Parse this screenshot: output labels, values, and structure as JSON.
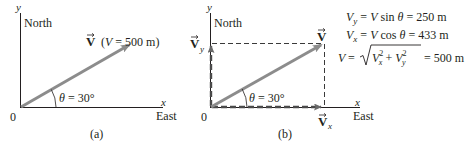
{
  "colors": {
    "axis": "#231f20",
    "vector": "#8c8c8c",
    "dashed": "#3a3a3a",
    "text": "#231f20",
    "background": "#ffffff"
  },
  "panel_a": {
    "caption": "(a)",
    "y_axis_label": "y",
    "x_axis_label": "x",
    "north_label": "North",
    "east_label": "East",
    "origin_label": "0",
    "vector_symbol": "V",
    "vector_annotation_open": "(",
    "vector_annotation_var": "V",
    "vector_annotation_rest": " = 500 m)",
    "angle_symbol": "θ",
    "angle_value": " = 30°"
  },
  "panel_b": {
    "caption": "(b)",
    "y_axis_label": "y",
    "x_axis_label": "x",
    "north_label": "North",
    "east_label": "East",
    "origin_label": "0",
    "vector_symbol": "V",
    "vy_symbol": "V",
    "vy_sub": "y",
    "vx_symbol": "V",
    "vx_sub": "x",
    "angle_symbol": "θ",
    "angle_value": " = 30°"
  },
  "equations": {
    "vy": {
      "lhs": "V",
      "lhs_sub": "y",
      "rhs_pre": " = ",
      "rhs_var": "V",
      "rhs_func": " sin ",
      "rhs_theta": "θ",
      "rhs_result": " = 250 m"
    },
    "vx": {
      "lhs": "V",
      "lhs_sub": "x",
      "rhs_pre": " = ",
      "rhs_var": "V",
      "rhs_func": " cos ",
      "rhs_theta": "θ",
      "rhs_result": " = 433 m"
    },
    "magnitude": {
      "lhs": "V",
      "eq": " = ",
      "term1": "V",
      "term1_sub": "x",
      "term1_sup": "2",
      "plus": " + ",
      "term2": "V",
      "term2_sub": "y",
      "term2_sup": "2",
      "result": " = 500 m"
    }
  }
}
